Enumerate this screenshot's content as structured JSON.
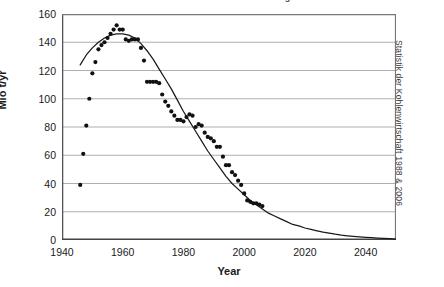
{
  "figure": {
    "title_clipped": "Deutsche Steinkohlenförderung",
    "source_note": "Statistik der Kohlenwirtschaft 1988 & 2006"
  },
  "chart_data": {
    "type": "scatter",
    "title": "",
    "xlabel": "Year",
    "ylabel": "Mio t/yr",
    "xlim": [
      1940,
      2050
    ],
    "ylim": [
      0,
      160
    ],
    "grid": true,
    "legend": null,
    "x_ticks": [
      1940,
      1960,
      1980,
      2000,
      2020,
      2040
    ],
    "x_minor_tick_step": 10,
    "y_ticks": [
      0,
      20,
      40,
      60,
      80,
      100,
      120,
      140,
      160
    ],
    "series": [
      {
        "name": "Observed production",
        "type": "scatter",
        "marker": "filled-circle",
        "color": "#111111",
        "points": [
          [
            1946,
            39
          ],
          [
            1947,
            61
          ],
          [
            1948,
            81
          ],
          [
            1949,
            100
          ],
          [
            1950,
            118
          ],
          [
            1951,
            126
          ],
          [
            1952,
            135
          ],
          [
            1953,
            138
          ],
          [
            1954,
            140
          ],
          [
            1955,
            143
          ],
          [
            1956,
            146
          ],
          [
            1957,
            149
          ],
          [
            1958,
            152
          ],
          [
            1959,
            149
          ],
          [
            1960,
            149
          ],
          [
            1961,
            142
          ],
          [
            1962,
            141
          ],
          [
            1963,
            142
          ],
          [
            1964,
            142
          ],
          [
            1965,
            142
          ],
          [
            1966,
            136
          ],
          [
            1967,
            127
          ],
          [
            1968,
            112
          ],
          [
            1969,
            112
          ],
          [
            1970,
            112
          ],
          [
            1971,
            112
          ],
          [
            1972,
            111
          ],
          [
            1973,
            103
          ],
          [
            1974,
            98
          ],
          [
            1975,
            95
          ],
          [
            1976,
            91
          ],
          [
            1977,
            88
          ],
          [
            1978,
            85
          ],
          [
            1979,
            85
          ],
          [
            1980,
            84
          ],
          [
            1981,
            87
          ],
          [
            1982,
            89
          ],
          [
            1983,
            88
          ],
          [
            1984,
            80
          ],
          [
            1985,
            82
          ],
          [
            1986,
            81
          ],
          [
            1987,
            76
          ],
          [
            1988,
            73
          ],
          [
            1989,
            72
          ],
          [
            1990,
            70
          ],
          [
            1991,
            66
          ],
          [
            1992,
            66
          ],
          [
            1993,
            59
          ],
          [
            1994,
            53
          ],
          [
            1995,
            53
          ],
          [
            1996,
            48
          ],
          [
            1997,
            46
          ],
          [
            1998,
            42
          ],
          [
            1999,
            39
          ],
          [
            2000,
            33
          ],
          [
            2001,
            28
          ],
          [
            2002,
            27
          ],
          [
            2003,
            26
          ],
          [
            2004,
            26
          ],
          [
            2005,
            25
          ],
          [
            2006,
            24
          ]
        ]
      },
      {
        "name": "Fitted depletion curve",
        "type": "line",
        "color": "#1a1a1a",
        "points": [
          [
            1946,
            124
          ],
          [
            1948,
            131
          ],
          [
            1950,
            136
          ],
          [
            1952,
            140
          ],
          [
            1954,
            143
          ],
          [
            1956,
            145
          ],
          [
            1958,
            146
          ],
          [
            1960,
            146
          ],
          [
            1962,
            145
          ],
          [
            1964,
            143
          ],
          [
            1966,
            139
          ],
          [
            1968,
            134
          ],
          [
            1970,
            128
          ],
          [
            1972,
            121
          ],
          [
            1974,
            114
          ],
          [
            1976,
            107
          ],
          [
            1978,
            99
          ],
          [
            1980,
            91
          ],
          [
            1982,
            84
          ],
          [
            1984,
            77
          ],
          [
            1986,
            70
          ],
          [
            1988,
            63
          ],
          [
            1990,
            57
          ],
          [
            1992,
            51
          ],
          [
            1994,
            45
          ],
          [
            1996,
            40
          ],
          [
            1998,
            36
          ],
          [
            2000,
            32
          ],
          [
            2002,
            28
          ],
          [
            2004,
            25
          ],
          [
            2006,
            22
          ],
          [
            2008,
            19
          ],
          [
            2010,
            17
          ],
          [
            2012,
            15
          ],
          [
            2014,
            13
          ],
          [
            2016,
            11
          ],
          [
            2018,
            10
          ],
          [
            2020,
            8.5
          ],
          [
            2022,
            7.5
          ],
          [
            2024,
            6.5
          ],
          [
            2026,
            5.5
          ],
          [
            2028,
            4.8
          ],
          [
            2030,
            4.1
          ],
          [
            2032,
            3.5
          ],
          [
            2034,
            3.0
          ],
          [
            2036,
            2.6
          ],
          [
            2038,
            2.2
          ],
          [
            2040,
            1.9
          ],
          [
            2042,
            1.6
          ],
          [
            2044,
            1.3
          ],
          [
            2046,
            1.1
          ],
          [
            2048,
            0.9
          ],
          [
            2050,
            0.7
          ]
        ]
      }
    ]
  }
}
